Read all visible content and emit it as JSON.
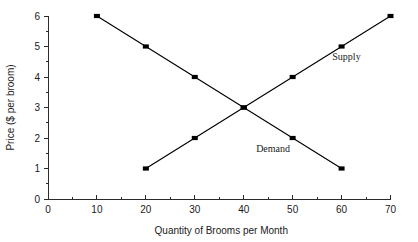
{
  "chart_data": {
    "type": "line",
    "title": "",
    "xlabel": "Quantity of Brooms per Month",
    "ylabel": "Price ($ per broom)",
    "xlim": [
      0,
      70
    ],
    "ylim": [
      0,
      6
    ],
    "xticks": [
      0,
      10,
      20,
      30,
      40,
      50,
      60,
      70
    ],
    "xtick_labels": [
      "0",
      "10",
      "20",
      "30",
      "40",
      "50",
      "60",
      "70"
    ],
    "x_minor_step": 5,
    "yticks": [
      0,
      1,
      2,
      3,
      4,
      5,
      6
    ],
    "ytick_labels": [
      "0",
      "1",
      "2",
      "3",
      "4",
      "5",
      "6"
    ],
    "y_minor_step": 0.5,
    "grid": false,
    "legend_position": "inline-annotation",
    "marker": "filled-square",
    "line_color": "#000000",
    "marker_color": "#000000",
    "axis_color": "#2b2b2b",
    "background": "#ffffff",
    "series": [
      {
        "name": "Demand",
        "x": [
          10,
          20,
          30,
          40,
          50,
          60
        ],
        "values": [
          6,
          5,
          4,
          3,
          2,
          1
        ],
        "label_x": 46,
        "label_y": 1.55
      },
      {
        "name": "Supply",
        "x": [
          20,
          30,
          40,
          50,
          60,
          70
        ],
        "values": [
          1,
          2,
          3,
          4,
          5,
          6
        ],
        "label_x": 61,
        "label_y": 4.55
      }
    ],
    "annotations": [
      {
        "name": "equilibrium",
        "x": 40,
        "y": 3
      }
    ]
  },
  "labels": {
    "x_axis_title": "Quantity of Brooms per Month",
    "y_axis_title": "Price ($ per broom)",
    "supply": "Supply",
    "demand": "Demand"
  }
}
